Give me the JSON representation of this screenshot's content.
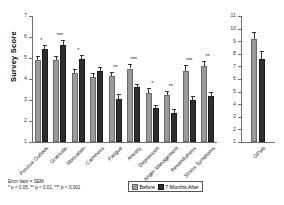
{
  "chart_data": {
    "type": "bar",
    "title": "",
    "xlabel": "",
    "ylabel": "Survey Score",
    "grid": false,
    "legend_position": "bottom-right",
    "panels": [
      {
        "name": "main-panel",
        "ylim": [
          1,
          7
        ],
        "yticks": [
          1,
          2,
          3,
          4,
          5,
          6,
          7
        ],
        "categories": [
          "Positive Outlook",
          "Gratitude",
          "Motivation",
          "Calmness",
          "Fatigue",
          "Anxiety",
          "Depression",
          "Anger Management",
          "Resentfulness",
          "Stress Symptoms"
        ],
        "series": [
          {
            "name": "Before",
            "values": [
              4.9,
              4.9,
              4.3,
              4.1,
              4.15,
              4.5,
              3.35,
              3.25,
              4.4,
              4.6
            ],
            "errors": [
              0.18,
              0.18,
              0.18,
              0.18,
              0.2,
              0.22,
              0.2,
              0.18,
              0.25,
              0.25
            ]
          },
          {
            "name": "7 Months After",
            "values": [
              5.45,
              5.6,
              4.95,
              4.4,
              3.05,
              3.6,
              2.6,
              2.4,
              3.0,
              3.2
            ],
            "errors": [
              0.15,
              0.28,
              0.18,
              0.18,
              0.22,
              0.18,
              0.18,
              0.15,
              0.18,
              0.2
            ]
          }
        ],
        "significance": [
          "*",
          "***",
          "*",
          "",
          "**",
          "***",
          "*",
          "**",
          "***",
          "**"
        ]
      },
      {
        "name": "gpwb-panel",
        "ylim": [
          1,
          11
        ],
        "yticks": [
          1,
          2,
          3,
          4,
          5,
          6,
          7,
          8,
          9,
          10,
          11
        ],
        "categories": [
          "GPwb"
        ],
        "series": [
          {
            "name": "Before",
            "values": [
              9.2
            ],
            "errors": [
              0.55
            ]
          },
          {
            "name": "7 Months After",
            "values": [
              7.6
            ],
            "errors": [
              0.6
            ]
          }
        ],
        "significance": [
          ""
        ]
      }
    ]
  },
  "legend": {
    "items": [
      {
        "label": "Before",
        "color": "#9a9a9a"
      },
      {
        "label": "7 Months After",
        "color": "#2e2e2e"
      }
    ]
  },
  "footnote": {
    "line1": "Error bars = SEM",
    "line2": "* p < 0.05, ** p < 0.01, *** p < 0.001"
  }
}
